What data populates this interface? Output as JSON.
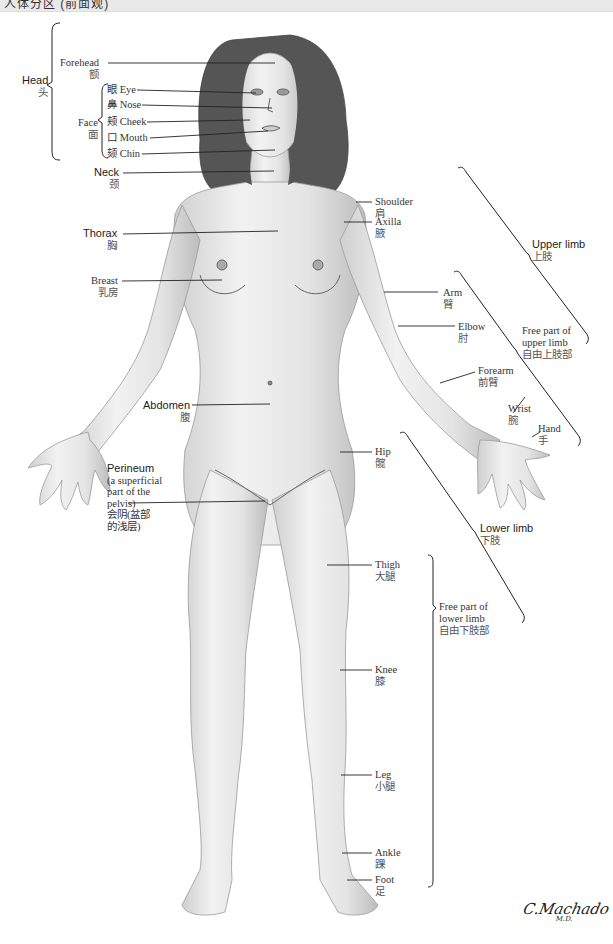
{
  "top_bar": {
    "text": "人体分区 (前面观)"
  },
  "figure": {
    "name": "anterior-female-body-regions",
    "skin_color": "#e9e9e9",
    "shade_color": "#bdbdbd",
    "hair_color": "#4a4a4a",
    "line_color": "#222222"
  },
  "labels": {
    "head": {
      "en": "Head",
      "zh": "头"
    },
    "forehead": {
      "en": "Forehead",
      "zh": "额"
    },
    "face": {
      "en": "Face",
      "zh": "面"
    },
    "eye": {
      "en": "眼 Eye"
    },
    "nose": {
      "en": "鼻 Nose"
    },
    "cheek": {
      "en": "颊 Cheek"
    },
    "mouth": {
      "en": "口 Mouth"
    },
    "chin": {
      "en": "颏 Chin"
    },
    "neck": {
      "en": "Neck",
      "zh": "颈"
    },
    "thorax": {
      "en": "Thorax",
      "zh": "胸"
    },
    "breast": {
      "en": "Breast",
      "zh": "乳房"
    },
    "abdomen": {
      "en": "Abdomen",
      "zh": "腹"
    },
    "perineum": {
      "en1": "Perineum",
      "en2": "(a superficial",
      "en3": "part of the",
      "en4": "pelvis)",
      "zh1": "会阴(盆部",
      "zh2": "的浅层)"
    },
    "shoulder": {
      "en": "Shoulder",
      "zh": "肩"
    },
    "axilla": {
      "en": "Axilla",
      "zh": "腋"
    },
    "upper_limb": {
      "en": "Upper limb",
      "zh": "上肢"
    },
    "arm": {
      "en": "Arm",
      "zh": "臂"
    },
    "elbow": {
      "en": "Elbow",
      "zh": "肘"
    },
    "free_upper": {
      "en1": "Free part of",
      "en2": "upper limb",
      "zh": "自由上肢部"
    },
    "forearm": {
      "en": "Forearm",
      "zh": "前臂"
    },
    "wrist": {
      "en": "Wrist",
      "zh": "腕"
    },
    "hand": {
      "en": "Hand",
      "zh": "手"
    },
    "hip": {
      "en": "Hip",
      "zh": "髋"
    },
    "lower_limb": {
      "en": "Lower limb",
      "zh": "下肢"
    },
    "thigh": {
      "en": "Thigh",
      "zh": "大腿"
    },
    "free_lower": {
      "en1": "Free part of",
      "en2": "lower limb",
      "zh": "自由下肢部"
    },
    "knee": {
      "en": "Knee",
      "zh": "膝"
    },
    "leg": {
      "en": "Leg",
      "zh": "小腿"
    },
    "ankle": {
      "en": "Ankle",
      "zh": "踝"
    },
    "foot": {
      "en": "Foot",
      "zh": "足"
    }
  },
  "signature": {
    "name": "C.Machado",
    "suffix": "M.D."
  }
}
